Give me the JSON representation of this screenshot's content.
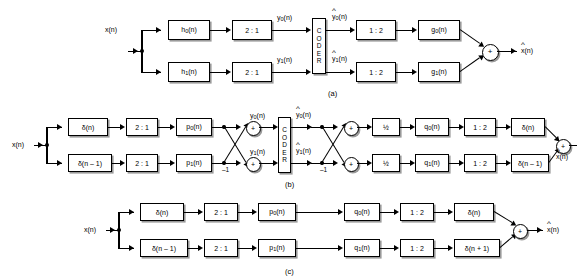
{
  "figure": {
    "signals": {
      "input": "x(n)",
      "output": "x̂(n)",
      "y0": "y0(n)",
      "y1": "y1(n)",
      "y0_hat": "ŷ0(n)",
      "y1_hat": "ŷ1(n)",
      "neg_one": "–1"
    },
    "coder_label": "CODER",
    "coder_letters": [
      "C",
      "O",
      "D",
      "E",
      "R"
    ],
    "sum_symbol": "+"
  },
  "panel_a": {
    "caption": "(a)",
    "input_label": "x(n)",
    "output_label": "x̂(n)",
    "blocks": {
      "h0": "h0(n)",
      "h1": "h1(n)",
      "down0": "2 : 1",
      "down1": "2 : 1",
      "up0": "1 : 2",
      "up1": "1 : 2",
      "g0": "g0(n)",
      "g1": "g1(n)"
    },
    "labels": {
      "y0": "y0(n)",
      "y1": "y1(n)",
      "y0_hat": "ŷ0(n)",
      "y1_hat": "ŷ1(n)"
    }
  },
  "panel_b": {
    "caption": "(b)",
    "input_label": "x(n)",
    "output_label": "x̂(n)",
    "blocks": {
      "delta0": "δ(n)",
      "delta1": "δ(n – 1)",
      "down0": "2 : 1",
      "down1": "2 : 1",
      "p0": "p0(n)",
      "p1": "p1(n)",
      "half0": "½",
      "half1": "½",
      "q0": "q0(n)",
      "q1": "q1(n)",
      "up0": "1 : 2",
      "up1": "1 : 2",
      "out_delta0": "δ(n)",
      "out_delta1": "δ(n – 1)"
    },
    "labels": {
      "y0": "y0(n)",
      "y1": "y1(n)",
      "y0_hat": "ŷ0(n)",
      "y1_hat": "ŷ1(n)",
      "neg_left": "–1",
      "neg_right": "–1"
    }
  },
  "panel_c": {
    "caption": "(c)",
    "input_label": "x(n)",
    "output_label": "x̂(n)",
    "blocks": {
      "delta0": "δ(n)",
      "delta1": "δ(n – 1)",
      "down0": "2 : 1",
      "down1": "2 : 1",
      "p0": "p0(n)",
      "p1": "p1(n)",
      "q0": "q0(n)",
      "q1": "q1(n)",
      "up0": "1 : 2",
      "up1": "1 : 2",
      "out_delta0": "δ(n)",
      "out_delta1": "δ(n + 1)"
    }
  }
}
